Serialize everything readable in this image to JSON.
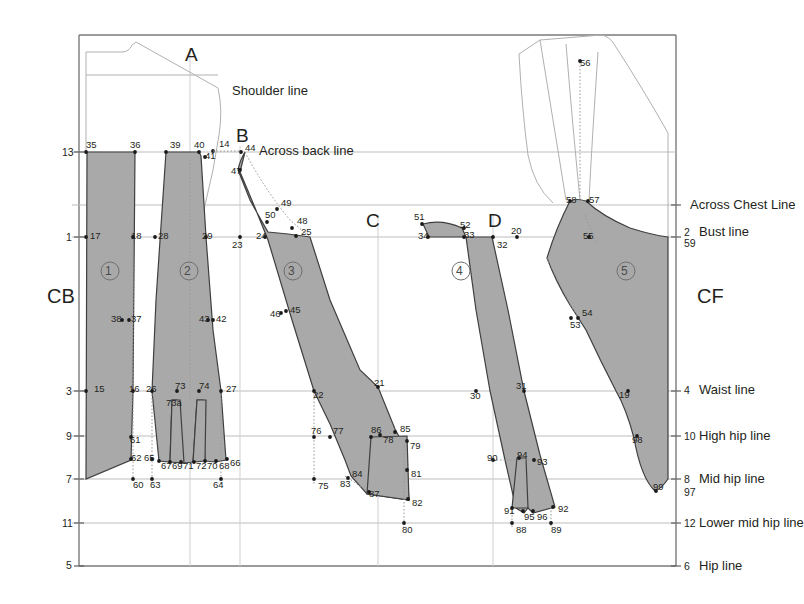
{
  "meta": {
    "width": 796,
    "height": 604
  },
  "colors": {
    "panel_fill": "#a9a9a9",
    "panel_stroke": "#3f3f3f",
    "guide_line": "#b9b9b9",
    "frame": "#7a7a7a",
    "outline_light": "#b0b0b0",
    "text": "#231f20",
    "dot": "#1a1a1a",
    "dotted": "#9a9a9a"
  },
  "axis_labels_left": [
    {
      "text": "13",
      "x": 62,
      "y": 152
    },
    {
      "text": "1",
      "x": 66,
      "y": 237
    },
    {
      "text": "3",
      "x": 66,
      "y": 391
    },
    {
      "text": "9",
      "x": 66,
      "y": 436
    },
    {
      "text": "7",
      "x": 66,
      "y": 479
    },
    {
      "text": "11",
      "x": 62,
      "y": 523
    },
    {
      "text": "5",
      "x": 66,
      "y": 565
    }
  ],
  "axis_labels_right": [
    {
      "num": "2",
      "label": "Bust line",
      "y": 232
    },
    {
      "num": "59",
      "label": "",
      "y": 243
    },
    {
      "num": "4",
      "label": "Waist line",
      "y": 390
    },
    {
      "num": "10",
      "label": "High hip line",
      "y": 436
    },
    {
      "num": "8",
      "label": "Mid hip line",
      "y": 479
    },
    {
      "num": "97",
      "label": "",
      "y": 492
    },
    {
      "num": "12",
      "label": "Lower mid hip line",
      "y": 523
    },
    {
      "num": "6",
      "label": "Hip line",
      "y": 566
    }
  ],
  "line_labels": [
    {
      "text": "Shoulder line",
      "x": 232,
      "y": 91
    },
    {
      "text": "Across back line",
      "x": 259,
      "y": 151
    },
    {
      "text": "Across Chest Line",
      "x": 690,
      "y": 205
    }
  ],
  "letters": [
    {
      "text": "A",
      "x": 185,
      "y": 55
    },
    {
      "text": "B",
      "x": 236,
      "y": 136
    },
    {
      "text": "C",
      "x": 366,
      "y": 221
    },
    {
      "text": "D",
      "x": 488,
      "y": 221
    },
    {
      "text": "CB",
      "x": 47,
      "y": 296
    },
    {
      "text": "CF",
      "x": 697,
      "y": 296
    }
  ],
  "panel_numbers": [
    {
      "text": "1",
      "x": 105,
      "y": 271
    },
    {
      "text": "2",
      "x": 184,
      "y": 271
    },
    {
      "text": "3",
      "x": 288,
      "y": 271
    },
    {
      "text": "4",
      "x": 456,
      "y": 271
    },
    {
      "text": "5",
      "x": 621,
      "y": 271
    }
  ],
  "point_labels": [
    {
      "t": "35",
      "x": 86,
      "y": 145
    },
    {
      "t": "36",
      "x": 130,
      "y": 145
    },
    {
      "t": "39",
      "x": 170,
      "y": 145
    },
    {
      "t": "40",
      "x": 194,
      "y": 145
    },
    {
      "t": "41",
      "x": 205,
      "y": 156
    },
    {
      "t": "14",
      "x": 219,
      "y": 144
    },
    {
      "t": "44",
      "x": 245,
      "y": 148
    },
    {
      "t": "47",
      "x": 231,
      "y": 171
    },
    {
      "t": "49",
      "x": 281,
      "y": 203
    },
    {
      "t": "50",
      "x": 265,
      "y": 215
    },
    {
      "t": "48",
      "x": 297,
      "y": 221
    },
    {
      "t": "25",
      "x": 301,
      "y": 232
    },
    {
      "t": "17",
      "x": 90,
      "y": 236
    },
    {
      "t": "18",
      "x": 131,
      "y": 236
    },
    {
      "t": "28",
      "x": 158,
      "y": 236
    },
    {
      "t": "29",
      "x": 202,
      "y": 236
    },
    {
      "t": "23",
      "x": 232,
      "y": 245
    },
    {
      "t": "24",
      "x": 256,
      "y": 236
    },
    {
      "t": "34",
      "x": 418,
      "y": 236
    },
    {
      "t": "51",
      "x": 414,
      "y": 217
    },
    {
      "t": "52",
      "x": 460,
      "y": 225
    },
    {
      "t": "33",
      "x": 464,
      "y": 235
    },
    {
      "t": "20",
      "x": 511,
      "y": 231
    },
    {
      "t": "32",
      "x": 497,
      "y": 245
    },
    {
      "t": "56",
      "x": 580,
      "y": 63
    },
    {
      "t": "58",
      "x": 566,
      "y": 200
    },
    {
      "t": "57",
      "x": 589,
      "y": 200
    },
    {
      "t": "55",
      "x": 583,
      "y": 236
    },
    {
      "t": "38",
      "x": 111,
      "y": 319
    },
    {
      "t": "37",
      "x": 131,
      "y": 319
    },
    {
      "t": "43",
      "x": 199,
      "y": 319
    },
    {
      "t": "42",
      "x": 216,
      "y": 319
    },
    {
      "t": "46",
      "x": 270,
      "y": 314
    },
    {
      "t": "45",
      "x": 290,
      "y": 310
    },
    {
      "t": "54",
      "x": 582,
      "y": 313
    },
    {
      "t": "53",
      "x": 570,
      "y": 325
    },
    {
      "t": "15",
      "x": 94,
      "y": 389
    },
    {
      "t": "16",
      "x": 129,
      "y": 389
    },
    {
      "t": "26",
      "x": 146,
      "y": 389
    },
    {
      "t": "73",
      "x": 175,
      "y": 386
    },
    {
      "t": "73a",
      "x": 166,
      "y": 403
    },
    {
      "t": "74",
      "x": 199,
      "y": 386
    },
    {
      "t": "27",
      "x": 226,
      "y": 389
    },
    {
      "t": "22",
      "x": 313,
      "y": 395
    },
    {
      "t": "21",
      "x": 374,
      "y": 383
    },
    {
      "t": "30",
      "x": 470,
      "y": 396
    },
    {
      "t": "31",
      "x": 516,
      "y": 386
    },
    {
      "t": "19",
      "x": 619,
      "y": 395
    },
    {
      "t": "61",
      "x": 130,
      "y": 440
    },
    {
      "t": "62",
      "x": 131,
      "y": 458
    },
    {
      "t": "65",
      "x": 144,
      "y": 458
    },
    {
      "t": "76",
      "x": 311,
      "y": 431
    },
    {
      "t": "77",
      "x": 333,
      "y": 431
    },
    {
      "t": "86",
      "x": 371,
      "y": 430
    },
    {
      "t": "78",
      "x": 383,
      "y": 440
    },
    {
      "t": "85",
      "x": 400,
      "y": 429
    },
    {
      "t": "79",
      "x": 410,
      "y": 446
    },
    {
      "t": "98",
      "x": 632,
      "y": 440
    },
    {
      "t": "67",
      "x": 161,
      "y": 466
    },
    {
      "t": "69",
      "x": 172,
      "y": 466
    },
    {
      "t": "71",
      "x": 183,
      "y": 466
    },
    {
      "t": "72",
      "x": 196,
      "y": 466
    },
    {
      "t": "70",
      "x": 207,
      "y": 466
    },
    {
      "t": "68",
      "x": 219,
      "y": 466
    },
    {
      "t": "66",
      "x": 230,
      "y": 463
    },
    {
      "t": "60",
      "x": 133,
      "y": 485
    },
    {
      "t": "63",
      "x": 150,
      "y": 485
    },
    {
      "t": "64",
      "x": 213,
      "y": 485
    },
    {
      "t": "84",
      "x": 352,
      "y": 474
    },
    {
      "t": "83",
      "x": 340,
      "y": 484
    },
    {
      "t": "75",
      "x": 318,
      "y": 486
    },
    {
      "t": "81",
      "x": 411,
      "y": 474
    },
    {
      "t": "87",
      "x": 369,
      "y": 494
    },
    {
      "t": "82",
      "x": 412,
      "y": 503
    },
    {
      "t": "80",
      "x": 402,
      "y": 530
    },
    {
      "t": "90",
      "x": 487,
      "y": 458
    },
    {
      "t": "94",
      "x": 517,
      "y": 455
    },
    {
      "t": "93",
      "x": 537,
      "y": 462
    },
    {
      "t": "91",
      "x": 504,
      "y": 511
    },
    {
      "t": "95",
      "x": 524,
      "y": 517
    },
    {
      "t": "96",
      "x": 537,
      "y": 517
    },
    {
      "t": "92",
      "x": 558,
      "y": 509
    },
    {
      "t": "88",
      "x": 516,
      "y": 530
    },
    {
      "t": "89",
      "x": 551,
      "y": 530
    },
    {
      "t": "99",
      "x": 653,
      "y": 487
    }
  ],
  "guides": {
    "horizontal": [
      152,
      237,
      205,
      391,
      436,
      479,
      523,
      566
    ],
    "vertical": [
      190,
      240,
      378,
      493
    ]
  }
}
